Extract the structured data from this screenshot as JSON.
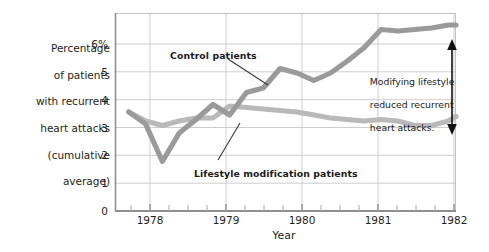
{
  "chart_data": {
    "type": "line",
    "title": "",
    "xlabel": "Year",
    "ylabel": "Percentage of patients with recurrent heart attacks (cumulative average)",
    "ylabel_lines": [
      "Percentage",
      "of patients",
      "with recurrent",
      "heart attacks",
      "(cumulative",
      "average)"
    ],
    "x_tick_labels": [
      "1978",
      "1979",
      "1980",
      "1981",
      "1982"
    ],
    "x_tick_values": [
      1978,
      1979,
      1980,
      1981,
      1982
    ],
    "y_tick_labels": [
      "0",
      "1",
      "2",
      "3",
      "4",
      "5",
      "6%"
    ],
    "y_tick_values": [
      0,
      1,
      2,
      3,
      4,
      5,
      6
    ],
    "xlim": [
      1977.54,
      1982.0
    ],
    "ylim": [
      0,
      6.6
    ],
    "grid": "both",
    "minor_x_ticks_per_year": 4,
    "legend_position": "inline-callouts",
    "series": [
      {
        "name": "Control patients",
        "color": "#9a9a9a",
        "x": [
          1977.72,
          1977.94,
          1978.16,
          1978.38,
          1978.6,
          1978.82,
          1979.04,
          1979.26,
          1979.48,
          1979.7,
          1979.92,
          1980.14,
          1980.36,
          1980.58,
          1980.8,
          1981.02,
          1981.24,
          1981.46,
          1981.68,
          1981.9,
          1982.0
        ],
        "values": [
          3.3,
          2.9,
          1.65,
          2.6,
          3.05,
          3.55,
          3.2,
          3.95,
          4.1,
          4.75,
          4.6,
          4.35,
          4.6,
          5.0,
          5.45,
          6.05,
          6.0,
          6.05,
          6.1,
          6.2,
          6.2
        ]
      },
      {
        "name": "Lifestyle modification patients",
        "color": "#b9b9b9",
        "x": [
          1977.72,
          1977.94,
          1978.16,
          1978.38,
          1978.6,
          1978.82,
          1979.04,
          1979.26,
          1979.48,
          1979.7,
          1979.92,
          1980.14,
          1980.36,
          1980.58,
          1980.8,
          1981.02,
          1981.24,
          1981.46,
          1981.68,
          1981.9,
          1982.0
        ],
        "values": [
          3.3,
          3.0,
          2.85,
          3.0,
          3.1,
          3.1,
          3.5,
          3.45,
          3.4,
          3.35,
          3.3,
          3.2,
          3.1,
          3.05,
          3.0,
          3.05,
          3.0,
          2.85,
          2.85,
          3.0,
          3.15
        ]
      }
    ],
    "annotations": [
      {
        "id": "control-callout",
        "text": "Control patients",
        "target_series": "Control patients"
      },
      {
        "id": "lifestyle-callout",
        "text": "Lifestyle modification patients",
        "target_series": "Lifestyle modification patients"
      },
      {
        "id": "gap-annotation",
        "text": "Modifying lifestyle reduced recurrent heart attacks.",
        "lines": [
          "Modifying lifestyle",
          "reduced recurrent",
          "heart attacks."
        ],
        "arrow": "double-headed-vertical"
      }
    ],
    "colors": {
      "control_line": "#9a9a9a",
      "lifestyle_line": "#b9b9b9",
      "grid": "#c9c9c9",
      "axis": "#8d8d8d",
      "text": "#231f20",
      "background": "#ffffff",
      "annotation_arrow": "#1a1a1a"
    }
  }
}
